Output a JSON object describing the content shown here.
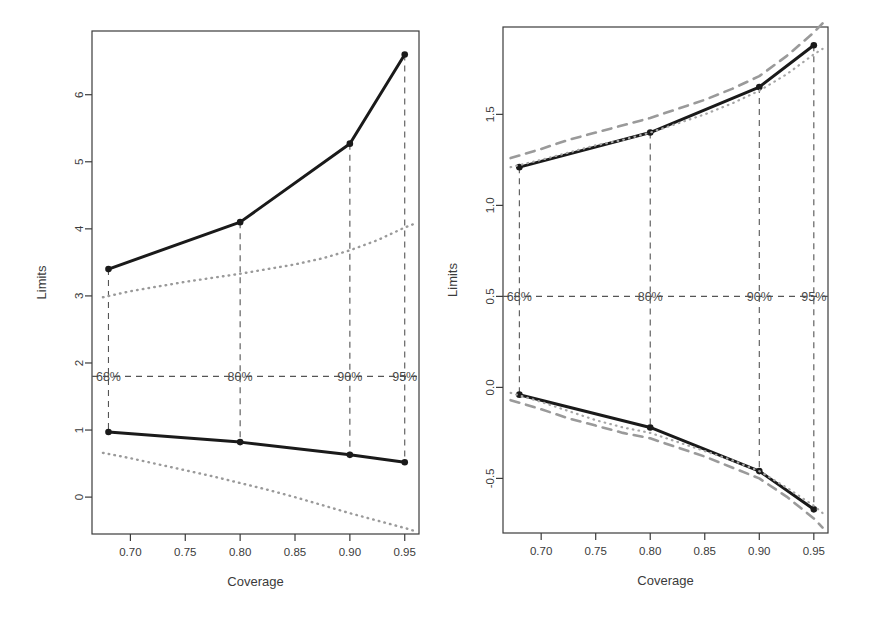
{
  "figure": {
    "background": "#ffffff",
    "panel_count": 2
  },
  "chart_data": [
    {
      "type": "line",
      "panel": "left",
      "title": "",
      "xlabel": "Coverage",
      "ylabel": "Limits",
      "xlim": [
        0.665,
        0.963
      ],
      "ylim": [
        -0.55,
        6.95
      ],
      "xticks": [
        0.7,
        0.75,
        0.8,
        0.85,
        0.9,
        0.95
      ],
      "xticklabels": [
        "0.70",
        "0.75",
        "0.80",
        "0.85",
        "0.90",
        "0.95"
      ],
      "yticks": [
        0,
        1,
        2,
        3,
        4,
        5,
        6
      ],
      "yticklabels": [
        "0",
        "1",
        "2",
        "3",
        "4",
        "5",
        "6"
      ],
      "grid": false,
      "legend": "none",
      "x": [
        0.68,
        0.8,
        0.9,
        0.95
      ],
      "series": [
        {
          "name": "upper-limit-solid",
          "style": "solid",
          "color": "#1a1a1a",
          "width": 3.0,
          "markers": true,
          "values": [
            3.4,
            4.1,
            5.27,
            6.6
          ]
        },
        {
          "name": "lower-limit-solid",
          "style": "solid",
          "color": "#1a1a1a",
          "width": 3.0,
          "markers": true,
          "values": [
            0.97,
            0.82,
            0.63,
            0.52
          ]
        },
        {
          "name": "upper-limit-dotted",
          "style": "dotted",
          "color": "#9a9a9a",
          "width": 2.4,
          "markers": false,
          "x_dense": [
            0.675,
            0.7,
            0.725,
            0.75,
            0.775,
            0.8,
            0.825,
            0.85,
            0.875,
            0.9,
            0.925,
            0.95,
            0.958
          ],
          "values": [
            2.98,
            3.07,
            3.14,
            3.21,
            3.27,
            3.33,
            3.4,
            3.47,
            3.56,
            3.68,
            3.83,
            4.02,
            4.07
          ]
        },
        {
          "name": "lower-limit-dotted",
          "style": "dotted",
          "color": "#9a9a9a",
          "width": 2.4,
          "markers": false,
          "x_dense": [
            0.675,
            0.7,
            0.725,
            0.75,
            0.775,
            0.8,
            0.825,
            0.85,
            0.875,
            0.9,
            0.925,
            0.95,
            0.958
          ],
          "values": [
            0.66,
            0.58,
            0.49,
            0.4,
            0.31,
            0.21,
            0.11,
            0.0,
            -0.12,
            -0.24,
            -0.35,
            -0.46,
            -0.5
          ]
        }
      ],
      "annotations": [
        {
          "text": "68%",
          "x": 0.68,
          "y": 1.8
        },
        {
          "text": "80%",
          "x": 0.8,
          "y": 1.8
        },
        {
          "text": "90%",
          "x": 0.9,
          "y": 1.8
        },
        {
          "text": "95%",
          "x": 0.95,
          "y": 1.8
        }
      ],
      "guide_lines": {
        "horizontal_y": 1.8,
        "vertical_x": [
          0.68,
          0.8,
          0.9,
          0.95
        ],
        "style": "dashed",
        "color": "#555555"
      }
    },
    {
      "type": "line",
      "panel": "right",
      "title": "",
      "xlabel": "Coverage",
      "ylabel": "Limits",
      "xlim": [
        0.665,
        0.963
      ],
      "ylim": [
        -0.8,
        1.98
      ],
      "xticks": [
        0.7,
        0.75,
        0.8,
        0.85,
        0.9,
        0.95
      ],
      "xticklabels": [
        "0.70",
        "0.75",
        "0.80",
        "0.85",
        "0.90",
        "0.95"
      ],
      "yticks": [
        -0.5,
        0.0,
        0.5,
        1.0,
        1.5
      ],
      "yticklabels": [
        "-0.5",
        "0.0",
        "0.5",
        "1.0",
        "1.5"
      ],
      "grid": false,
      "legend": "none",
      "x": [
        0.68,
        0.8,
        0.9,
        0.95
      ],
      "series": [
        {
          "name": "upper-limit-solid",
          "style": "solid",
          "color": "#1a1a1a",
          "width": 3.0,
          "markers": true,
          "values": [
            1.21,
            1.4,
            1.65,
            1.88
          ]
        },
        {
          "name": "lower-limit-solid",
          "style": "solid",
          "color": "#1a1a1a",
          "width": 3.0,
          "markers": true,
          "values": [
            -0.04,
            -0.22,
            -0.46,
            -0.67
          ]
        },
        {
          "name": "upper-limit-dashed",
          "style": "dashed",
          "color": "#9a9a9a",
          "width": 2.6,
          "markers": false,
          "x_dense": [
            0.672,
            0.7,
            0.725,
            0.75,
            0.775,
            0.8,
            0.825,
            0.85,
            0.875,
            0.9,
            0.925,
            0.95,
            0.958
          ],
          "values": [
            1.26,
            1.31,
            1.36,
            1.4,
            1.44,
            1.48,
            1.53,
            1.58,
            1.64,
            1.71,
            1.82,
            1.95,
            2.0
          ]
        },
        {
          "name": "lower-limit-dashed",
          "style": "dashed",
          "color": "#9a9a9a",
          "width": 2.6,
          "markers": false,
          "x_dense": [
            0.672,
            0.7,
            0.725,
            0.75,
            0.775,
            0.8,
            0.825,
            0.85,
            0.875,
            0.9,
            0.925,
            0.95,
            0.958
          ],
          "values": [
            -0.07,
            -0.12,
            -0.17,
            -0.21,
            -0.25,
            -0.28,
            -0.33,
            -0.38,
            -0.44,
            -0.5,
            -0.6,
            -0.72,
            -0.77
          ]
        },
        {
          "name": "upper-limit-dotted",
          "style": "dotted",
          "color": "#a6a6a6",
          "width": 2.2,
          "markers": false,
          "x_dense": [
            0.672,
            0.7,
            0.725,
            0.75,
            0.775,
            0.8,
            0.825,
            0.85,
            0.875,
            0.9,
            0.925,
            0.95,
            0.958
          ],
          "values": [
            1.21,
            1.25,
            1.29,
            1.33,
            1.36,
            1.4,
            1.45,
            1.5,
            1.56,
            1.63,
            1.72,
            1.83,
            1.86
          ]
        },
        {
          "name": "lower-limit-dotted",
          "style": "dotted",
          "color": "#a6a6a6",
          "width": 2.2,
          "markers": false,
          "x_dense": [
            0.672,
            0.7,
            0.725,
            0.75,
            0.775,
            0.8,
            0.825,
            0.85,
            0.875,
            0.9,
            0.925,
            0.95,
            0.958
          ],
          "values": [
            -0.03,
            -0.08,
            -0.13,
            -0.18,
            -0.22,
            -0.25,
            -0.3,
            -0.35,
            -0.4,
            -0.46,
            -0.55,
            -0.65,
            -0.69
          ]
        }
      ],
      "annotations": [
        {
          "text": "68%",
          "x": 0.68,
          "y": 0.5
        },
        {
          "text": "80%",
          "x": 0.8,
          "y": 0.5
        },
        {
          "text": "90%",
          "x": 0.9,
          "y": 0.5
        },
        {
          "text": "95%",
          "x": 0.95,
          "y": 0.5
        }
      ],
      "guide_lines": {
        "horizontal_y": 0.5,
        "vertical_x": [
          0.68,
          0.8,
          0.9,
          0.95
        ],
        "style": "dashed",
        "color": "#555555"
      }
    }
  ],
  "colors": {
    "axis": "#3b3b3b",
    "solid_line": "#1a1a1a",
    "gray_line": "#9a9a9a",
    "guide_line": "#555555",
    "background": "#ffffff"
  }
}
